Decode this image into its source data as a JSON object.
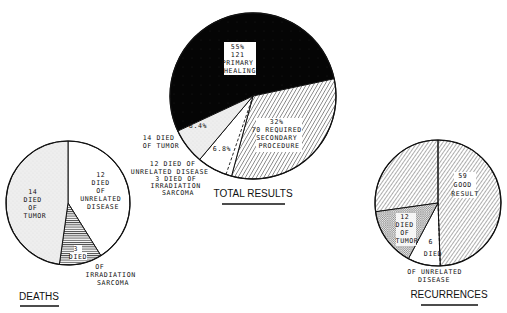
{
  "chart_data": [
    {
      "type": "pie",
      "title": "TOTAL RESULTS",
      "center": [
        253,
        96
      ],
      "radius": 83,
      "slices": [
        {
          "label": "Primary healing",
          "value": 121,
          "percent": 55,
          "fill": "solid",
          "text": [
            "55%",
            "121",
            "PRIMARY",
            "HEALING"
          ]
        },
        {
          "label": "Required secondary procedure",
          "value": 70,
          "percent": 32,
          "fill": "hatch",
          "text": [
            "32%",
            "70 REQUIRED",
            "SECONDARY",
            "PROCEDURE"
          ]
        },
        {
          "label": "Died of unrelated disease",
          "value": 12,
          "percent": 6.8,
          "fill": "white",
          "text": [
            "6.8%"
          ],
          "note": "includes 3 died of irradiation sarcoma (dashed division)"
        },
        {
          "label": "Died of tumor",
          "value": 14,
          "percent": 6.4,
          "fill": "stipple",
          "text": [
            "6.4%"
          ]
        }
      ],
      "annotations": [
        "14 DIED OF TUMOR",
        "12 DIED OF UNRELATED DISEASE",
        "3 DIED OF IRRADIATION SARCOMA"
      ]
    },
    {
      "type": "pie",
      "title": "DEATHS",
      "center": [
        68,
        203
      ],
      "radius": 62,
      "slices": [
        {
          "label": "Died of unrelated disease",
          "value": 12,
          "fill": "white",
          "text": [
            "12",
            "DIED",
            "OF",
            "UNRELATED",
            "DISEASE"
          ]
        },
        {
          "label": "Died of irradiation sarcoma",
          "value": 3,
          "fill": "hlines",
          "text": [
            "3",
            "DIED"
          ]
        },
        {
          "label": "Died of tumor",
          "value": 14,
          "fill": "stipple",
          "text": [
            "14",
            "DIED",
            "OF",
            "TUMOR"
          ]
        }
      ],
      "annotations": [
        "OF",
        "IRRADIATION",
        "SARCOMA"
      ]
    },
    {
      "type": "pie",
      "title": "RECURRENCES",
      "center": [
        438,
        203
      ],
      "radius": 63,
      "slices": [
        {
          "label": "Good result",
          "value": 59,
          "fill": "hatch",
          "text": [
            "59",
            "GOOD",
            "RESULT"
          ]
        },
        {
          "label": "Died of unrelated disease",
          "value": 6,
          "fill": "white",
          "text": [
            "6",
            "DIED"
          ]
        },
        {
          "label": "Died of tumor",
          "value": 12,
          "fill": "dots",
          "text": [
            "12",
            "DIED",
            "OF",
            "TUMOR"
          ]
        }
      ],
      "annotations": [
        "OF UNRELATED",
        "DISEASE"
      ]
    }
  ],
  "labels": {
    "total": {
      "title": "TOTAL RESULTS",
      "primary": [
        "55%",
        "121",
        "PRIMARY",
        "HEALING"
      ],
      "secondary": [
        "32%",
        "70 REQUIRED",
        "SECONDARY",
        "PROCEDURE"
      ],
      "pct_tumor": "6.4%",
      "pct_unrelated": "6.8%",
      "left_tumor": [
        "14 DIED",
        "OF TUMOR"
      ],
      "left_unrelated": [
        "12 DIED OF",
        "UNRELATED DISEASE",
        "3 DIED OF",
        "IRRADIATION",
        "SARCOMA"
      ]
    },
    "deaths": {
      "title": "DEATHS",
      "unrelated": [
        "12",
        "DIED",
        "OF",
        "UNRELATED",
        "DISEASE"
      ],
      "tumor": [
        "14",
        "DIED",
        "OF",
        "TUMOR"
      ],
      "sarcoma": [
        "3",
        "DIED"
      ],
      "sarcoma_out": [
        "OF",
        "IRRADIATION",
        "SARCOMA"
      ]
    },
    "recurrences": {
      "title": "RECURRENCES",
      "good": [
        "59",
        "GOOD",
        "RESULT"
      ],
      "tumor": [
        "12",
        "DIED",
        "OF",
        "TUMOR"
      ],
      "unrelated": [
        "6",
        "DIED"
      ],
      "unrelated_out": [
        "OF UNRELATED",
        "DISEASE"
      ]
    }
  },
  "colors": {
    "ink": "#111111",
    "paper": "#ffffff",
    "stipple": "#e6e6e6"
  }
}
